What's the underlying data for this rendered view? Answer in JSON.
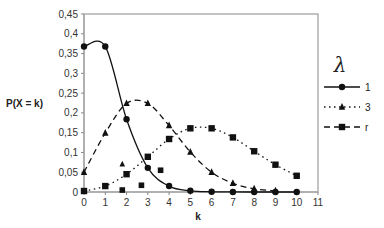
{
  "chart_data": {
    "type": "line",
    "title": "",
    "xlabel": "k",
    "ylabel": "P(X = k)",
    "xlim": [
      0,
      11
    ],
    "ylim": [
      0,
      0.45
    ],
    "x_ticks": [
      "0",
      "1",
      "2",
      "3",
      "4",
      "5",
      "6",
      "7",
      "8",
      "9",
      "10",
      "11"
    ],
    "y_ticks": [
      "0",
      "0,05",
      "0,1",
      "0,15",
      "0,2",
      "0,25",
      "0,3",
      "0,35",
      "0,4",
      "0,45"
    ],
    "legend_title": "λ",
    "legend_position": "right",
    "grid": false,
    "series": [
      {
        "name": "1",
        "marker": "circle",
        "line": "solid",
        "x": [
          0,
          1,
          2,
          3,
          4,
          5,
          6,
          7,
          8,
          9,
          10
        ],
        "values": [
          0.368,
          0.368,
          0.184,
          0.061,
          0.015,
          0.003,
          0.0005,
          0.0001,
          0,
          0,
          0
        ]
      },
      {
        "name": "3",
        "marker": "triangle",
        "line": "dashed",
        "x": [
          0,
          1,
          2,
          3,
          4,
          5,
          6,
          7,
          8,
          9
        ],
        "values": [
          0.05,
          0.149,
          0.224,
          0.224,
          0.168,
          0.101,
          0.05,
          0.022,
          0.008,
          0.003
        ]
      },
      {
        "name": "r",
        "marker": "square",
        "line": "dotted",
        "x": [
          0,
          1,
          2,
          3,
          4,
          5,
          6,
          7,
          8,
          9,
          10
        ],
        "values": [
          0.0025,
          0.015,
          0.045,
          0.089,
          0.134,
          0.161,
          0.161,
          0.138,
          0.103,
          0.069,
          0.041
        ]
      }
    ],
    "stray_markers": [
      {
        "marker": "triangle",
        "x": 1.8,
        "y": 0.07
      },
      {
        "marker": "square",
        "x": 1.8,
        "y": 0.005
      },
      {
        "marker": "square",
        "x": 2.7,
        "y": 0.017
      },
      {
        "marker": "square",
        "x": 3.6,
        "y": 0.055
      }
    ]
  },
  "legend": {
    "title": "λ",
    "items": [
      {
        "label": "1",
        "marker": "circle",
        "line": "solid"
      },
      {
        "label": "3",
        "marker": "triangle",
        "line": "dotted"
      },
      {
        "label": "r",
        "marker": "square",
        "line": "dashed"
      }
    ]
  },
  "axes": {
    "xlabel": "k",
    "ylabel": "P(X = k)"
  }
}
